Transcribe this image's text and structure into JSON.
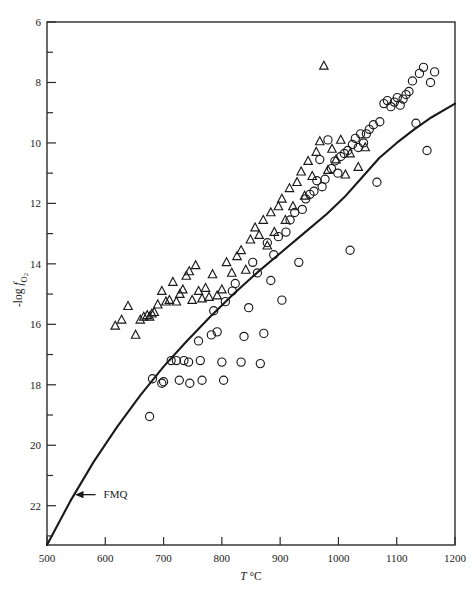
{
  "chart_data": {
    "type": "scatter",
    "title": "",
    "xlabel": "T °C",
    "ylabel": "-log fO2",
    "ylabel_parts": {
      "prefix": "-log ",
      "italic": "f",
      "sub": "O2"
    },
    "xlim": [
      500,
      1200
    ],
    "ylim": [
      6,
      23.3
    ],
    "y_inverted": true,
    "grid": false,
    "legend": null,
    "xticks": [
      500,
      600,
      700,
      800,
      900,
      1000,
      1100,
      1200
    ],
    "xtick_labels": [
      "500",
      "600",
      "700",
      "800",
      "900",
      "1000",
      "1100",
      "1200"
    ],
    "x_minor_step": 100,
    "yticks": [
      6,
      8,
      10,
      12,
      14,
      16,
      18,
      20,
      22
    ],
    "ytick_labels": [
      "6",
      "8",
      "10",
      "12",
      "14",
      "16",
      "18",
      "20",
      "22"
    ],
    "y_minor_ticks": [
      7,
      9,
      11,
      13,
      15,
      17,
      19,
      21,
      23
    ],
    "annotations": [
      {
        "text": "FMQ",
        "x": 597,
        "y": 21.75,
        "arrow_to_x": 548,
        "arrow_to_y": 21.75
      }
    ],
    "series": [
      {
        "name": "curve-fmq",
        "type": "line",
        "label": "FMQ buffer curve",
        "points": [
          [
            500,
            23.3
          ],
          [
            540,
            21.85
          ],
          [
            580,
            20.55
          ],
          [
            620,
            19.4
          ],
          [
            660,
            18.35
          ],
          [
            700,
            17.4
          ],
          [
            740,
            16.55
          ],
          [
            780,
            15.75
          ],
          [
            820,
            15.0
          ],
          [
            860,
            14.3
          ],
          [
            900,
            13.65
          ],
          [
            940,
            13.0
          ],
          [
            980,
            12.35
          ],
          [
            1010,
            11.8
          ],
          [
            1040,
            11.15
          ],
          [
            1070,
            10.5
          ],
          [
            1100,
            10.0
          ],
          [
            1130,
            9.55
          ],
          [
            1160,
            9.15
          ],
          [
            1200,
            8.7
          ]
        ]
      },
      {
        "name": "circles",
        "type": "scatter",
        "marker": "open-circle",
        "label": "open circles",
        "points": [
          [
            676,
            19.05
          ],
          [
            681,
            17.8
          ],
          [
            697,
            17.95
          ],
          [
            700,
            17.9
          ],
          [
            713,
            17.2
          ],
          [
            722,
            17.2
          ],
          [
            727,
            17.85
          ],
          [
            735,
            17.2
          ],
          [
            743,
            17.25
          ],
          [
            745,
            17.95
          ],
          [
            760,
            16.55
          ],
          [
            763,
            17.2
          ],
          [
            766,
            17.85
          ],
          [
            782,
            16.35
          ],
          [
            786,
            15.55
          ],
          [
            792,
            16.25
          ],
          [
            800,
            17.25
          ],
          [
            803,
            17.85
          ],
          [
            806,
            15.25
          ],
          [
            818,
            14.9
          ],
          [
            823,
            14.65
          ],
          [
            833,
            17.25
          ],
          [
            838,
            16.4
          ],
          [
            846,
            15.45
          ],
          [
            853,
            13.95
          ],
          [
            861,
            14.3
          ],
          [
            866,
            17.3
          ],
          [
            872,
            16.3
          ],
          [
            878,
            13.3
          ],
          [
            884,
            14.55
          ],
          [
            889,
            13.7
          ],
          [
            897,
            13.1
          ],
          [
            903,
            15.2
          ],
          [
            910,
            12.95
          ],
          [
            917,
            12.55
          ],
          [
            925,
            12.3
          ],
          [
            932,
            13.95
          ],
          [
            938,
            12.2
          ],
          [
            944,
            11.85
          ],
          [
            951,
            11.7
          ],
          [
            958,
            11.6
          ],
          [
            963,
            11.25
          ],
          [
            968,
            10.55
          ],
          [
            972,
            11.45
          ],
          [
            977,
            11.2
          ],
          [
            982,
            9.9
          ],
          [
            988,
            10.85
          ],
          [
            994,
            10.6
          ],
          [
            999,
            11.0
          ],
          [
            1004,
            10.45
          ],
          [
            1010,
            10.35
          ],
          [
            1016,
            10.25
          ],
          [
            1020,
            13.55
          ],
          [
            1024,
            10.05
          ],
          [
            1029,
            9.85
          ],
          [
            1034,
            10.15
          ],
          [
            1038,
            9.7
          ],
          [
            1043,
            10.0
          ],
          [
            1048,
            9.7
          ],
          [
            1053,
            9.55
          ],
          [
            1060,
            9.4
          ],
          [
            1066,
            11.3
          ],
          [
            1071,
            9.3
          ],
          [
            1078,
            8.7
          ],
          [
            1084,
            8.6
          ],
          [
            1090,
            8.8
          ],
          [
            1096,
            8.65
          ],
          [
            1101,
            8.5
          ],
          [
            1106,
            8.75
          ],
          [
            1111,
            8.55
          ],
          [
            1116,
            8.4
          ],
          [
            1121,
            8.3
          ],
          [
            1127,
            7.95
          ],
          [
            1133,
            9.35
          ],
          [
            1139,
            7.7
          ],
          [
            1146,
            7.5
          ],
          [
            1152,
            10.25
          ],
          [
            1158,
            8.0
          ],
          [
            1165,
            7.65
          ]
        ]
      },
      {
        "name": "triangles",
        "type": "scatter",
        "marker": "open-triangle",
        "label": "open triangles",
        "points": [
          [
            617,
            16.05
          ],
          [
            628,
            15.85
          ],
          [
            639,
            15.4
          ],
          [
            652,
            16.35
          ],
          [
            660,
            15.85
          ],
          [
            666,
            15.75
          ],
          [
            672,
            15.7
          ],
          [
            676,
            15.75
          ],
          [
            680,
            15.65
          ],
          [
            684,
            15.6
          ],
          [
            690,
            15.35
          ],
          [
            697,
            14.9
          ],
          [
            704,
            15.25
          ],
          [
            710,
            15.2
          ],
          [
            716,
            14.6
          ],
          [
            722,
            15.25
          ],
          [
            728,
            15.0
          ],
          [
            733,
            14.85
          ],
          [
            739,
            14.4
          ],
          [
            744,
            14.25
          ],
          [
            749,
            15.2
          ],
          [
            755,
            14.05
          ],
          [
            760,
            14.9
          ],
          [
            766,
            15.15
          ],
          [
            772,
            14.8
          ],
          [
            778,
            15.1
          ],
          [
            784,
            14.35
          ],
          [
            792,
            15.05
          ],
          [
            800,
            14.85
          ],
          [
            808,
            13.95
          ],
          [
            817,
            14.3
          ],
          [
            826,
            13.75
          ],
          [
            833,
            13.55
          ],
          [
            841,
            14.2
          ],
          [
            849,
            13.2
          ],
          [
            857,
            12.8
          ],
          [
            864,
            13.05
          ],
          [
            871,
            12.55
          ],
          [
            878,
            13.4
          ],
          [
            884,
            12.3
          ],
          [
            890,
            12.95
          ],
          [
            897,
            12.1
          ],
          [
            903,
            11.85
          ],
          [
            909,
            12.55
          ],
          [
            916,
            11.5
          ],
          [
            922,
            12.1
          ],
          [
            929,
            11.3
          ],
          [
            936,
            10.95
          ],
          [
            942,
            11.75
          ],
          [
            948,
            10.6
          ],
          [
            955,
            11.1
          ],
          [
            962,
            10.3
          ],
          [
            968,
            9.95
          ],
          [
            975,
            7.45
          ],
          [
            982,
            10.9
          ],
          [
            989,
            10.2
          ],
          [
            996,
            10.55
          ],
          [
            1004,
            9.9
          ],
          [
            1012,
            11.05
          ],
          [
            1020,
            10.35
          ],
          [
            1034,
            10.8
          ],
          [
            1046,
            10.15
          ]
        ]
      }
    ]
  },
  "figure": {
    "background": "#ffffff",
    "axis_color": "#2b2b2b",
    "marker_color": "#1a1a1a",
    "curve_color": "#1a1a1a"
  }
}
